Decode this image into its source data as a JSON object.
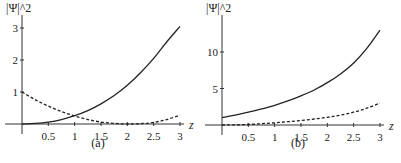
{
  "chart_data": [
    {
      "type": "line",
      "panel": "(a)",
      "ylabel": "|Ψ|^2",
      "xlabel": "z",
      "xlim": [
        0,
        3
      ],
      "ylim": [
        0,
        3.1
      ],
      "xticks": [
        0.5,
        1,
        1.5,
        2,
        2.5,
        3
      ],
      "xtick_labels": [
        "0.5",
        "1",
        "1.5",
        "2",
        "2.5",
        "3"
      ],
      "yticks": [
        1,
        2,
        3
      ],
      "ytick_labels": [
        "1",
        "2",
        "3"
      ],
      "grid": false,
      "x": [
        0,
        0.25,
        0.5,
        0.75,
        1,
        1.25,
        1.5,
        1.75,
        2,
        2.25,
        2.5,
        2.75,
        3
      ],
      "series": [
        {
          "name": "solid",
          "style": "solid",
          "values": [
            0,
            0.02,
            0.06,
            0.14,
            0.26,
            0.42,
            0.63,
            0.89,
            1.21,
            1.6,
            2.05,
            2.57,
            3.05
          ]
        },
        {
          "name": "dashed",
          "style": "dashed",
          "values": [
            1.0,
            0.76,
            0.56,
            0.39,
            0.25,
            0.14,
            0.06,
            0.02,
            0.0,
            0.01,
            0.05,
            0.14,
            0.28
          ]
        }
      ]
    },
    {
      "type": "line",
      "panel": "(b)",
      "ylabel": "|Ψ|^2",
      "xlabel": "z",
      "xlim": [
        0,
        3
      ],
      "ylim": [
        0,
        13.5
      ],
      "xticks": [
        0.5,
        1,
        1.5,
        2,
        2.5,
        3
      ],
      "xtick_labels": [
        "0.5",
        "1",
        "1.5",
        "2",
        "2.5",
        "3"
      ],
      "yticks": [
        5,
        10
      ],
      "ytick_labels": [
        "5",
        "10"
      ],
      "grid": false,
      "x": [
        0,
        0.25,
        0.5,
        0.75,
        1,
        1.25,
        1.5,
        1.75,
        2,
        2.25,
        2.5,
        2.75,
        3
      ],
      "series": [
        {
          "name": "solid",
          "style": "solid",
          "values": [
            1.0,
            1.35,
            1.75,
            2.2,
            2.7,
            3.3,
            4.0,
            4.8,
            5.8,
            7.0,
            8.5,
            10.5,
            13.0
          ]
        },
        {
          "name": "dashed",
          "style": "dashed",
          "values": [
            0.0,
            0.02,
            0.08,
            0.18,
            0.3,
            0.45,
            0.62,
            0.82,
            1.05,
            1.35,
            1.75,
            2.3,
            3.0
          ]
        }
      ]
    }
  ],
  "captions": [
    "(a)",
    "(b)"
  ],
  "ylabel_text": "|Ψ|^2",
  "xlabel_text": "z"
}
